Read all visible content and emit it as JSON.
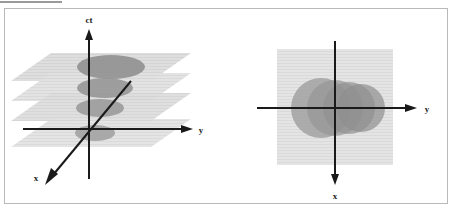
{
  "figure": {
    "panels": [
      {
        "id": "spacetime-3d",
        "name": "three-dimensional-spacetime-diagram",
        "axes": [
          {
            "id": "ct",
            "label": "ct",
            "direction": "up"
          },
          {
            "id": "y",
            "label": "y",
            "direction": "right"
          },
          {
            "id": "x",
            "label": "x",
            "direction": "down-left"
          }
        ],
        "planes": [
          {
            "index": 0,
            "name": "constant-time-slice",
            "fill": "#d9d9d9"
          },
          {
            "index": 1,
            "name": "constant-time-slice",
            "fill": "#d4d4d4"
          },
          {
            "index": 2,
            "name": "constant-time-slice",
            "fill": "#cfcfcf"
          },
          {
            "index": 3,
            "name": "constant-time-slice",
            "fill": "#cbcbcb"
          }
        ],
        "disks": [
          {
            "index": 0,
            "name": "light-cone-cross-section",
            "rx": 34,
            "ry": 12,
            "fill": "#8e8e8e"
          },
          {
            "index": 1,
            "name": "light-cone-cross-section",
            "rx": 28,
            "ry": 10,
            "fill": "#949494"
          },
          {
            "index": 2,
            "name": "light-cone-cross-section",
            "rx": 24,
            "ry": 9,
            "fill": "#9a9a9a"
          },
          {
            "index": 3,
            "name": "light-cone-cross-section",
            "rx": 20,
            "ry": 8,
            "fill": "#a0a0a0"
          }
        ]
      },
      {
        "id": "spatial-projection",
        "name": "top-down-spatial-projection",
        "axes": [
          {
            "id": "y",
            "label": "y",
            "direction": "right"
          },
          {
            "id": "x",
            "label": "x",
            "direction": "down"
          }
        ],
        "planes": [
          {
            "index": 0,
            "name": "projection-plane",
            "fill": "#e2e2e2"
          }
        ],
        "disks": [
          {
            "index": 0,
            "name": "projected-light-cone-disk",
            "r": 30,
            "fill": "#9a9a9a"
          },
          {
            "index": 1,
            "name": "projected-light-cone-disk",
            "r": 28,
            "fill": "#969696"
          },
          {
            "index": 2,
            "name": "projected-light-cone-disk",
            "r": 26,
            "fill": "#929292"
          },
          {
            "index": 3,
            "name": "projected-light-cone-disk",
            "r": 24,
            "fill": "#8e8e8e"
          }
        ]
      }
    ],
    "colors": {
      "axis": "#1a1a1a",
      "frame_border": "#b9b9b9",
      "top_rule": "#9a9a9a",
      "background": "#ffffff"
    }
  }
}
